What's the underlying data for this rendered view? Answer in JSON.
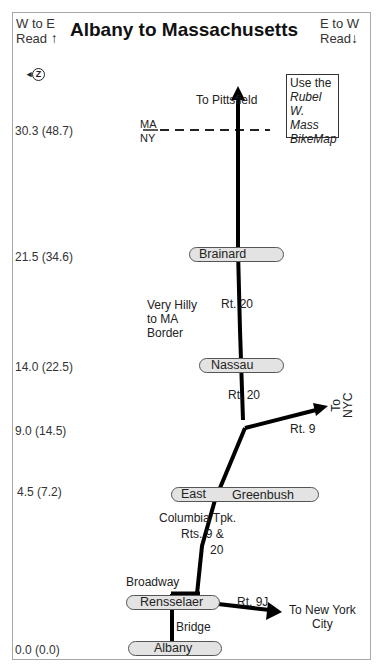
{
  "header": {
    "left_direction": "W to E",
    "left_read": "Read",
    "left_arrow": "↑",
    "title": "Albany to Massachusetts",
    "right_direction": "E to W",
    "right_read": "Read",
    "right_arrow": "↓"
  },
  "compass_icon": "←Z",
  "note": {
    "line1": "Use the",
    "line2": "Rubel",
    "line3": "W. Mass",
    "line4": "BikeMap"
  },
  "border": {
    "top_state": "MA",
    "bottom_state": "NY"
  },
  "mileposts": [
    {
      "label": "30.3 (48.7)",
      "miles": 30.3,
      "km": 48.7
    },
    {
      "label": "21.5 (34.6)",
      "miles": 21.5,
      "km": 34.6
    },
    {
      "label": "14.0 (22.5)",
      "miles": 14.0,
      "km": 22.5
    },
    {
      "label": "9.0 (14.5)",
      "miles": 9.0,
      "km": 14.5
    },
    {
      "label": "4.5 (7.2)",
      "miles": 4.5,
      "km": 7.2
    },
    {
      "label": "0.0 (0.0)",
      "miles": 0.0,
      "km": 0.0
    }
  ],
  "towns": {
    "brainard": "Brainard",
    "nassau": "Nassau",
    "east": "East",
    "greenbush": "Greenbush",
    "rensselaer": "Rensselaer",
    "albany": "Albany"
  },
  "labels": {
    "to_pittsfield": "To Pittsfield",
    "hilly1": "Very Hilly",
    "hilly2": "to MA",
    "hilly3": "Border",
    "rt20_upper": "Rt. 20",
    "rt20_lower": "Rt. 20",
    "rt9": "Rt. 9",
    "to_nyc_1": "To",
    "to_nyc_2": "NYC",
    "columbia1": "Columbia Tpk.",
    "columbia2": "Rts. 9 &",
    "columbia3": "20",
    "broadway": "Broadway",
    "bridge": "Bridge",
    "rt9j": "Rt. 9J",
    "to_ny_city1": "To New York",
    "to_ny_city2": "City"
  }
}
